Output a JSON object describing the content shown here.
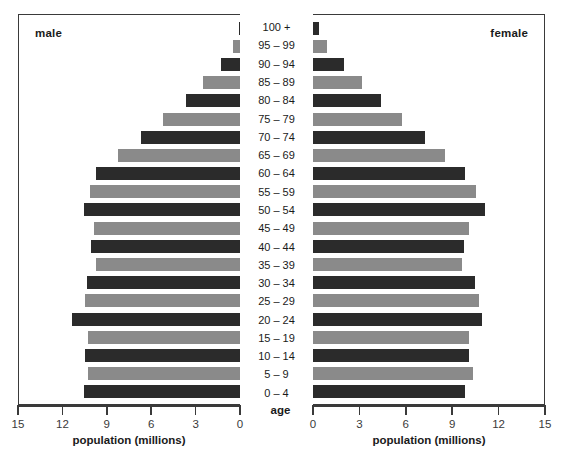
{
  "chart_data": {
    "type": "bar",
    "chart_kind": "population-pyramid",
    "title": "",
    "xlabel": "population (millions)",
    "ylabel": "age",
    "categories": [
      "0 – 4",
      "5 – 9",
      "10 – 14",
      "15 – 19",
      "20 – 24",
      "25 – 29",
      "30 – 34",
      "35 – 39",
      "40 – 44",
      "45 – 49",
      "50 – 54",
      "55 – 59",
      "60 – 64",
      "65 – 69",
      "70 – 74",
      "75 – 79",
      "80 – 84",
      "85 – 89",
      "90 – 94",
      "95 – 99",
      "100 +"
    ],
    "categories_top_to_bottom": [
      "100 +",
      "95 – 99",
      "90 – 94",
      "85 – 89",
      "80 – 84",
      "75 – 79",
      "70 – 74",
      "65 – 69",
      "60 – 64",
      "55 – 59",
      "50 – 54",
      "45 – 49",
      "40 – 44",
      "35 – 39",
      "30 – 34",
      "25 – 29",
      "20 – 24",
      "15 – 19",
      "10 – 14",
      "5 – 9",
      "0 – 4"
    ],
    "series": [
      {
        "name": "male",
        "side": "left",
        "color": "#2b2b2b",
        "alt_color": "#8a8a8a",
        "values_top_to_bottom": [
          0.1,
          0.5,
          1.3,
          2.5,
          3.7,
          5.2,
          6.7,
          8.3,
          9.8,
          10.2,
          10.6,
          9.9,
          10.1,
          9.8,
          10.4,
          10.5,
          11.4,
          10.3,
          10.5,
          10.3,
          10.6
        ]
      },
      {
        "name": "female",
        "side": "right",
        "color": "#2b2b2b",
        "alt_color": "#8a8a8a",
        "values_top_to_bottom": [
          0.4,
          0.9,
          2.0,
          3.2,
          4.4,
          5.8,
          7.3,
          8.6,
          9.9,
          10.6,
          11.2,
          10.1,
          9.8,
          9.7,
          10.5,
          10.8,
          11.0,
          10.1,
          10.1,
          10.4,
          9.9
        ]
      }
    ],
    "xlim_left": [
      15,
      0
    ],
    "xlim_right": [
      0,
      15
    ],
    "xticks_left": [
      "15",
      "12",
      "9",
      "6",
      "3",
      "0"
    ],
    "xticks_right": [
      "0",
      "3",
      "6",
      "9",
      "12",
      "15"
    ],
    "xtick_values_left": [
      15,
      12,
      9,
      6,
      3,
      0
    ],
    "xtick_values_right": [
      0,
      3,
      6,
      9,
      12,
      15
    ],
    "axis_max": 15,
    "grid": false,
    "legend_position": "inside-panel-corners",
    "bar_color_alternation": "alternating dark / gray by row"
  },
  "panels": {
    "left": {
      "label": "male"
    },
    "right": {
      "label": "female"
    }
  },
  "axes": {
    "age_title": "age",
    "x_title_left": "population (millions)",
    "x_title_right": "population (millions)"
  },
  "colors": {
    "bar_dark": "#2b2b2b",
    "bar_light": "#8a8a8a",
    "frame": "#3a3a3a",
    "text": "#1a1a1a",
    "background": "#ffffff"
  }
}
